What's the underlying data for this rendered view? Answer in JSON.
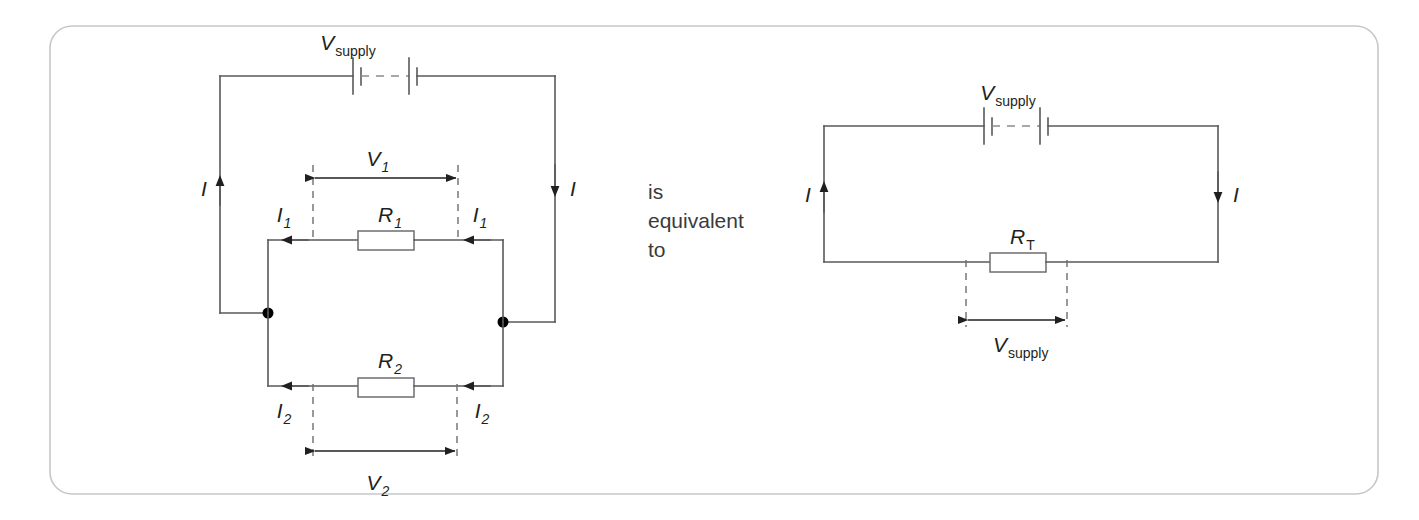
{
  "figure": {
    "kind": "circuit-diagram",
    "caption_text": [
      "is",
      "equivalent",
      "to"
    ],
    "panel_border_color": "#c6c7c9",
    "wire_color": "#58595b",
    "label_color": "#231f20"
  },
  "labels": {
    "v_supply_main": "V",
    "v_supply_sub": "supply",
    "v1_main": "V",
    "v1_sub": "1",
    "v2_main": "V",
    "v2_sub": "2",
    "r1_main": "R",
    "r1_sub": "1",
    "r2_main": "R",
    "r2_sub": "2",
    "rt_main": "R",
    "rt_sub": "T",
    "current_i": "I",
    "current_i1_main": "I",
    "current_i1_sub": "1",
    "current_i2_main": "I",
    "current_i2_sub": "2"
  },
  "left_circuit": {
    "title": "parallel-resistor-circuit",
    "supply_label": "V supply",
    "branches": [
      {
        "resistor": "R1",
        "voltage": "V1",
        "current": "I1"
      },
      {
        "resistor": "R2",
        "voltage": "V2",
        "current": "I2"
      }
    ],
    "main_current": "I",
    "components": [
      "battery",
      "R1",
      "R2",
      "junction-left",
      "junction-right"
    ]
  },
  "right_circuit": {
    "title": "equivalent-resistor-circuit",
    "supply_label": "V supply",
    "resistor": "RT",
    "voltage_across_resistor": "V supply",
    "main_current": "I",
    "components": [
      "battery",
      "RT"
    ]
  }
}
